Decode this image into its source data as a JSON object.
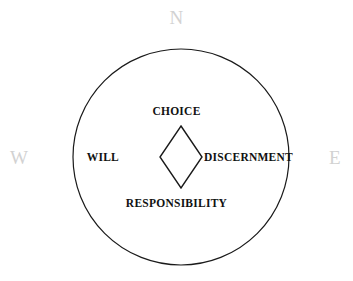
{
  "figure": {
    "type": "concentric-diagram",
    "background_color": "#ffffff",
    "outline_color": "#1a1a1a",
    "label_color": "#111111",
    "compass_color": "#d2d2d2",
    "circle": {
      "center_x": 181,
      "center_y": 157,
      "radius": 108,
      "stroke_width": 1.2
    },
    "diamond": {
      "center_x": 181,
      "center_y": 157,
      "half_width": 21,
      "half_height": 31,
      "stroke_width": 1.4
    }
  },
  "compass": {
    "north": "N",
    "west": "W",
    "east": "E"
  },
  "labels": {
    "top": "CHOICE",
    "left": "WILL",
    "right": "DISCERNMENT",
    "bottom": "RESPONSIBILITY"
  }
}
